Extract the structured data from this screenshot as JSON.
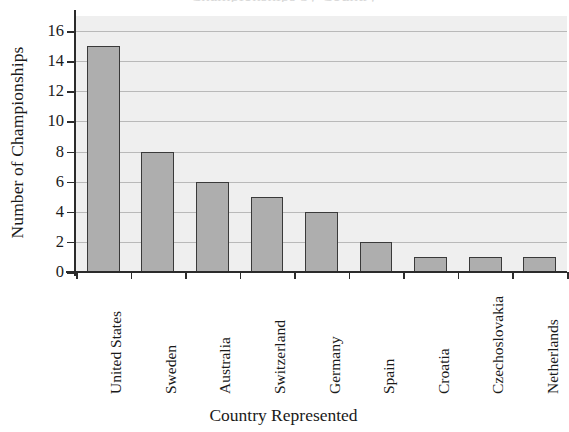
{
  "chart_data": {
    "type": "bar",
    "title": "",
    "xlabel": "Country Represented",
    "ylabel": "Number of Championships",
    "categories": [
      "United States",
      "Sweden",
      "Australia",
      "Switzerland",
      "Germany",
      "Spain",
      "Croatia",
      "Czechoslovakia",
      "Netherlands"
    ],
    "values": [
      15,
      8,
      6,
      5,
      4,
      2,
      1,
      1,
      1
    ],
    "ylim": [
      0,
      17
    ],
    "yticks": [
      0,
      2,
      4,
      6,
      8,
      10,
      12,
      14,
      16
    ],
    "ytick_labels": [
      "0",
      "2",
      "4",
      "6",
      "8",
      "10",
      "12",
      "14",
      "16"
    ],
    "grid": true,
    "grid_axis": "y",
    "legend": false,
    "bar_color": "#aeaeae",
    "bar_edge_color": "#3a3a3a",
    "plot_background": "#efefef",
    "gridline_color": "#b9b9b9",
    "axis_color": "#2b2b2b"
  },
  "figure": {
    "title_sliver": "Championships by Country"
  }
}
